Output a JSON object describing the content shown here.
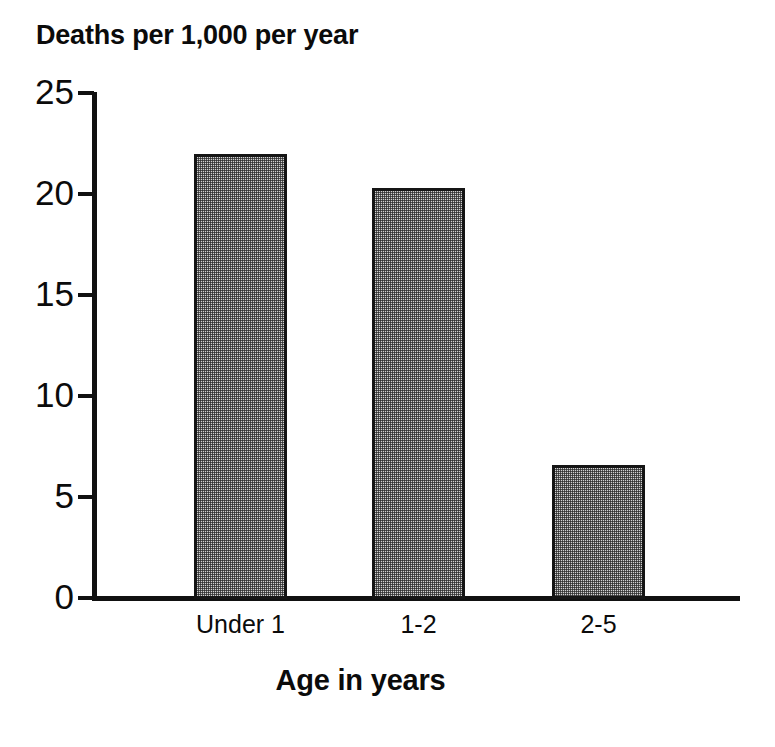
{
  "chart_data": {
    "type": "bar",
    "title": "Deaths per 1,000 per year",
    "xlabel": "Age in years",
    "ylabel": "",
    "categories": [
      "Under 1",
      "1-2",
      "2-5"
    ],
    "values": [
      22.0,
      20.3,
      6.6
    ],
    "series": [
      {
        "name": "Deaths per 1,000 per year",
        "values": [
          22.0,
          20.3,
          6.6
        ]
      }
    ],
    "ylim": [
      0,
      25
    ],
    "yticks": [
      0,
      5,
      10,
      15,
      20,
      25
    ],
    "ytick_labels": [
      "0",
      "5",
      "10",
      "15",
      "20",
      "25"
    ],
    "grid": false,
    "legend": false,
    "legend_position": "none",
    "bar_fill_color": "#d2d2d2",
    "bar_edge_color": "#151515",
    "axis_color": "#111111",
    "background_color": "#ffffff",
    "text_color": "#0b0b0b"
  },
  "bars": [
    {
      "category": "Under 1",
      "value": 22.0
    },
    {
      "category": "1-2",
      "value": 20.3
    },
    {
      "category": "2-5",
      "value": 6.6
    }
  ],
  "yticks": [
    {
      "label": "25",
      "value": 25
    },
    {
      "label": "20",
      "value": 20
    },
    {
      "label": "15",
      "value": 15
    },
    {
      "label": "10",
      "value": 10
    },
    {
      "label": "5",
      "value": 5
    },
    {
      "label": "0",
      "value": 0
    }
  ]
}
